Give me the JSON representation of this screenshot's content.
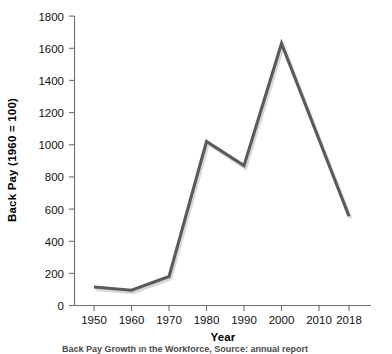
{
  "chart_data": {
    "type": "line",
    "title": "",
    "xlabel": "Year",
    "ylabel": "Back Pay (1960 = 100)",
    "x": [
      1950,
      1960,
      1970,
      1980,
      1990,
      2000,
      2018
    ],
    "values": [
      115,
      95,
      180,
      1020,
      870,
      1630,
      555
    ],
    "series": [
      {
        "name": "Back Pay Index",
        "values": [
          115,
          95,
          180,
          1020,
          870,
          1630,
          555
        ]
      }
    ],
    "xlim": [
      1945,
      2018
    ],
    "ylim": [
      0,
      1800
    ],
    "x_tick_labels": [
      "1950",
      "1960",
      "1970",
      "1980",
      "1990",
      "2000",
      "2010",
      "2018"
    ],
    "x_tick_values": [
      1950,
      1960,
      1970,
      1980,
      1990,
      2000,
      2010,
      2018
    ],
    "y_tick_labels": [
      "0",
      "200",
      "400",
      "600",
      "800",
      "1000",
      "1200",
      "1400",
      "1600",
      "1800"
    ],
    "y_tick_values": [
      0,
      200,
      400,
      600,
      800,
      1000,
      1200,
      1400,
      1600,
      1800
    ],
    "grid": false,
    "legend": false,
    "legend_position": "none",
    "line_color": "#5a5a5a",
    "axis_color": "#6e6e6e",
    "background_color": "#ffffff"
  },
  "axis": {
    "x_title": "Year",
    "y_title": "Back Pay (1960 = 100)"
  },
  "caption": {
    "text": "Back Pay Growth in the Workforce, Source: annual report"
  }
}
